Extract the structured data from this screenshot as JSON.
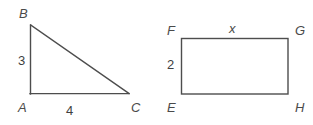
{
  "diagram": {
    "background_color": "#ffffff",
    "stroke_color": "#4d4d4d",
    "stroke_width": 1.4,
    "figures": [
      {
        "id": "triangle-abc",
        "type": "right-triangle",
        "vertices": [
          {
            "name": "B",
            "x": 30,
            "y": 25
          },
          {
            "name": "A",
            "x": 30,
            "y": 94
          },
          {
            "name": "C",
            "x": 129,
            "y": 94
          }
        ],
        "vertex_labels": [
          {
            "key": "B",
            "text": "B"
          },
          {
            "key": "A",
            "text": "A"
          },
          {
            "key": "C",
            "text": "C"
          }
        ],
        "side_labels": [
          {
            "key": "leg_vertical",
            "text": "3",
            "side": "AB"
          },
          {
            "key": "leg_horizontal",
            "text": "4",
            "side": "AC"
          }
        ]
      },
      {
        "id": "rectangle-efgh",
        "type": "rectangle",
        "corners": [
          {
            "name": "F",
            "x": 181,
            "y": 38
          },
          {
            "name": "G",
            "x": 288,
            "y": 38
          },
          {
            "name": "H",
            "x": 288,
            "y": 94
          },
          {
            "name": "E",
            "x": 181,
            "y": 94
          }
        ],
        "corner_labels": [
          {
            "key": "F",
            "text": "F"
          },
          {
            "key": "G",
            "text": "G"
          },
          {
            "key": "E",
            "text": "E"
          },
          {
            "key": "H",
            "text": "H"
          }
        ],
        "side_labels": [
          {
            "key": "width",
            "text": "x",
            "side": "FG"
          },
          {
            "key": "height",
            "text": "2",
            "side": "EF"
          }
        ]
      }
    ]
  },
  "labels": {
    "triangle": {
      "B": "B",
      "A": "A",
      "C": "C",
      "leg_vertical": "3",
      "leg_horizontal": "4"
    },
    "rectangle": {
      "F": "F",
      "G": "G",
      "E": "E",
      "H": "H",
      "width": "x",
      "height": "2"
    }
  }
}
